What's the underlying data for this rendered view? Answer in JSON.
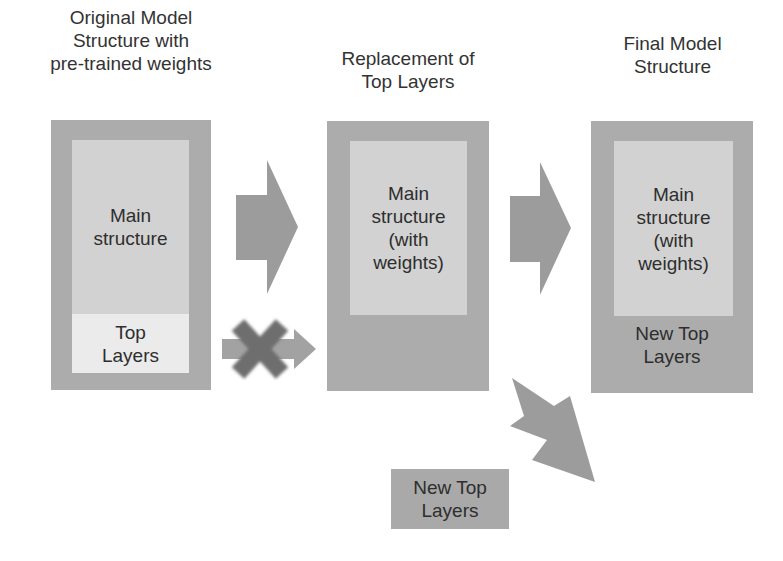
{
  "diagram": {
    "type": "transfer-learning-flow",
    "colors": {
      "outer_box": "#acacac",
      "inner_box": "#d2d2d2",
      "top_layers_light": "#ebebeb",
      "arrow": "#9c9c9c",
      "cross": "#6e6e6e",
      "text": "#2e2e2e"
    },
    "stages": [
      {
        "title": [
          "Original Model",
          "Structure with",
          "pre-trained weights"
        ],
        "main_label": [
          "Main",
          "structure"
        ],
        "top_label": [
          "Top",
          "Layers"
        ]
      },
      {
        "title": [
          "Replacement of",
          "Top Layers"
        ],
        "main_label": [
          "Main",
          "structure",
          "(with",
          "weights)"
        ]
      },
      {
        "title": [
          "Final Model",
          "Structure"
        ],
        "main_label": [
          "Main",
          "structure",
          "(with",
          "weights)"
        ],
        "top_label": [
          "New Top",
          "Layers"
        ]
      }
    ],
    "new_top_layers": [
      "New Top",
      "Layers"
    ],
    "arrows": [
      {
        "from": "stage-1-main",
        "to": "stage-2",
        "kind": "block-arrow"
      },
      {
        "from": "stage-1-top-layers",
        "to": "stage-2",
        "kind": "crossed-out-arrow"
      },
      {
        "from": "stage-2",
        "to": "stage-3",
        "kind": "block-arrow"
      },
      {
        "from": "new-top-layers",
        "to": "stage-3",
        "kind": "diagonal-block-arrow"
      }
    ]
  }
}
